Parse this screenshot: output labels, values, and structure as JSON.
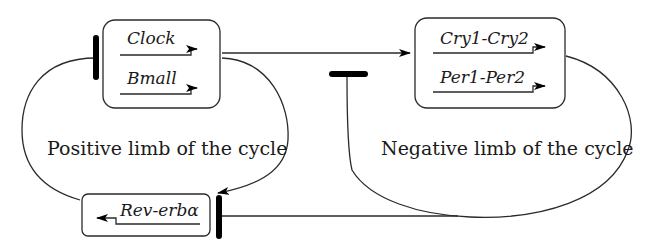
{
  "diagram": {
    "boxes": {
      "positive_box": {
        "genes": [
          {
            "name": "Clock"
          },
          {
            "name": "Bmall"
          }
        ]
      },
      "negative_box": {
        "genes": [
          {
            "name": "Cry1-Cry2"
          },
          {
            "name": "Per1-Per2"
          }
        ]
      },
      "reverb_box": {
        "genes": [
          {
            "name": "Rev-erbα"
          }
        ]
      }
    },
    "labels": {
      "positive_limb": "Positive limb of the cycle",
      "negative_limb": "Negative limb of the cycle"
    },
    "edges": [
      {
        "from": "Clock/Bmall",
        "to": "Cry1-Cry2/Per1-Per2",
        "type": "activation"
      },
      {
        "from": "Clock/Bmall",
        "to": "Rev-erbα",
        "type": "activation"
      },
      {
        "from": "Rev-erbα",
        "to": "Clock/Bmall",
        "type": "inhibition"
      },
      {
        "from": "Cry1-Cry2/Per1-Per2",
        "to": "Clock/Bmall pathway",
        "type": "inhibition"
      },
      {
        "from": "Cry1-Cry2/Per1-Per2",
        "to": "Rev-erbα",
        "type": "inhibition"
      }
    ],
    "colors": {
      "stroke": "#2a2a2a",
      "bar": "#000000",
      "background": "#ffffff"
    }
  }
}
